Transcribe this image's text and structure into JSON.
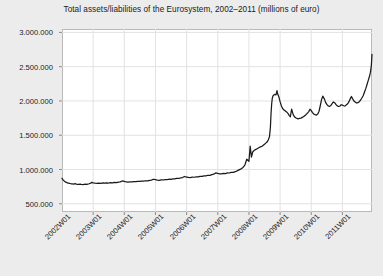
{
  "chart_data": {
    "type": "line",
    "title": "Total assets/liabilities of the Eurosystem, 2002–2011 (millions of euro)",
    "xlabel": "",
    "ylabel": "",
    "grid": true,
    "legend": false,
    "ylim": [
      380000,
      3050000
    ],
    "ytick_labels": [
      "3.000.000",
      "2.500.000",
      "2.000.000",
      "1.500.000",
      "1.000.000",
      "500.000"
    ],
    "ytick_values": [
      3000000,
      2500000,
      2000000,
      1500000,
      1000000,
      500000
    ],
    "xtick_labels": [
      "2002W01",
      "2003W01",
      "2004W01",
      "2005W01",
      "2006W01",
      "2007W01",
      "2008W01",
      "2009W01",
      "2010W01",
      "2011W01"
    ],
    "xlim": [
      2002.0,
      2011.95
    ],
    "series": [
      {
        "name": "Total assets/liabilities of the Eurosystem",
        "color": "#1a1a1a",
        "x": [
          2002.0,
          2002.04,
          2002.08,
          2002.12,
          2002.16,
          2002.2,
          2002.25,
          2002.29,
          2002.33,
          2002.37,
          2002.42,
          2002.46,
          2002.5,
          2002.54,
          2002.58,
          2002.62,
          2002.67,
          2002.71,
          2002.75,
          2002.79,
          2002.83,
          2002.87,
          2002.92,
          2002.96,
          2003.0,
          2003.06,
          2003.12,
          2003.18,
          2003.25,
          2003.31,
          2003.37,
          2003.43,
          2003.5,
          2003.56,
          2003.62,
          2003.68,
          2003.75,
          2003.81,
          2003.87,
          2003.93,
          2004.0,
          2004.06,
          2004.12,
          2004.18,
          2004.25,
          2004.31,
          2004.37,
          2004.43,
          2004.5,
          2004.56,
          2004.62,
          2004.68,
          2004.75,
          2004.81,
          2004.87,
          2004.93,
          2005.0,
          2005.06,
          2005.12,
          2005.18,
          2005.25,
          2005.31,
          2005.37,
          2005.43,
          2005.5,
          2005.56,
          2005.62,
          2005.68,
          2005.75,
          2005.81,
          2005.87,
          2005.93,
          2006.0,
          2006.06,
          2006.12,
          2006.18,
          2006.25,
          2006.31,
          2006.37,
          2006.43,
          2006.5,
          2006.56,
          2006.62,
          2006.68,
          2006.75,
          2006.81,
          2006.87,
          2006.93,
          2007.0,
          2007.06,
          2007.12,
          2007.18,
          2007.25,
          2007.31,
          2007.37,
          2007.43,
          2007.5,
          2007.56,
          2007.62,
          2007.68,
          2007.75,
          2007.81,
          2007.87,
          2007.93,
          2008.0,
          2008.04,
          2008.08,
          2008.12,
          2008.17,
          2008.21,
          2008.25,
          2008.29,
          2008.33,
          2008.37,
          2008.42,
          2008.46,
          2008.5,
          2008.54,
          2008.58,
          2008.62,
          2008.66,
          2008.69,
          2008.71,
          2008.73,
          2008.75,
          2008.77,
          2008.79,
          2008.83,
          2008.87,
          2008.9,
          2008.92,
          2008.96,
          2009.0,
          2009.04,
          2009.08,
          2009.12,
          2009.17,
          2009.21,
          2009.25,
          2009.29,
          2009.33,
          2009.37,
          2009.42,
          2009.46,
          2009.5,
          2009.54,
          2009.58,
          2009.62,
          2009.67,
          2009.71,
          2009.75,
          2009.79,
          2009.83,
          2009.87,
          2009.92,
          2009.96,
          2010.0,
          2010.04,
          2010.08,
          2010.12,
          2010.17,
          2010.21,
          2010.25,
          2010.29,
          2010.33,
          2010.37,
          2010.42,
          2010.46,
          2010.5,
          2010.54,
          2010.58,
          2010.62,
          2010.67,
          2010.71,
          2010.75,
          2010.79,
          2010.83,
          2010.87,
          2010.92,
          2010.96,
          2011.0,
          2011.04,
          2011.08,
          2011.12,
          2011.17,
          2011.21,
          2011.25,
          2011.29,
          2011.33,
          2011.37,
          2011.42,
          2011.46,
          2011.5,
          2011.54,
          2011.58,
          2011.62,
          2011.67,
          2011.71,
          2011.75,
          2011.79,
          2011.83,
          2011.87,
          2011.9,
          2011.93,
          2011.95
        ],
        "y": [
          872000,
          845000,
          828000,
          815000,
          808000,
          800000,
          796000,
          792000,
          790000,
          788000,
          793000,
          786000,
          784000,
          782000,
          786000,
          783000,
          781000,
          784000,
          786000,
          783000,
          788000,
          792000,
          800000,
          812000,
          806000,
          800000,
          797000,
          802000,
          799000,
          804000,
          800000,
          806000,
          803000,
          808000,
          805000,
          812000,
          808000,
          815000,
          820000,
          833000,
          826000,
          818000,
          815000,
          820000,
          818000,
          824000,
          822000,
          828000,
          826000,
          832000,
          830000,
          836000,
          834000,
          841000,
          845000,
          858000,
          851000,
          845000,
          843000,
          848000,
          847000,
          853000,
          852000,
          858000,
          857000,
          864000,
          863000,
          870000,
          869000,
          877000,
          883000,
          898000,
          890000,
          884000,
          882000,
          888000,
          887000,
          894000,
          893000,
          901000,
          900000,
          908000,
          907000,
          916000,
          915000,
          924000,
          932000,
          950000,
          942000,
          936000,
          935000,
          942000,
          941000,
          950000,
          949000,
          959000,
          958000,
          968000,
          980000,
          995000,
          1010000,
          1030000,
          1065000,
          1150000,
          1120000,
          1340000,
          1180000,
          1255000,
          1280000,
          1290000,
          1300000,
          1310000,
          1320000,
          1330000,
          1340000,
          1355000,
          1370000,
          1385000,
          1400000,
          1430000,
          1480000,
          1620000,
          1820000,
          1960000,
          2040000,
          2070000,
          2085000,
          2095000,
          2090000,
          2150000,
          2105000,
          2060000,
          1990000,
          1930000,
          1890000,
          1870000,
          1855000,
          1840000,
          1820000,
          1790000,
          1770000,
          1880000,
          1800000,
          1770000,
          1755000,
          1745000,
          1740000,
          1745000,
          1750000,
          1760000,
          1770000,
          1785000,
          1800000,
          1820000,
          1845000,
          1880000,
          1860000,
          1830000,
          1810000,
          1800000,
          1795000,
          1810000,
          1850000,
          1930000,
          2020000,
          2070000,
          2030000,
          1980000,
          1950000,
          1930000,
          1920000,
          1930000,
          1960000,
          1985000,
          1975000,
          1950000,
          1930000,
          1920000,
          1925000,
          1945000,
          1940000,
          1930000,
          1925000,
          1940000,
          1960000,
          1990000,
          2030000,
          2065000,
          2030000,
          2000000,
          1980000,
          1970000,
          1975000,
          1990000,
          2010000,
          2040000,
          2080000,
          2130000,
          2180000,
          2240000,
          2300000,
          2360000,
          2420000,
          2520000,
          2680000
        ]
      }
    ]
  }
}
